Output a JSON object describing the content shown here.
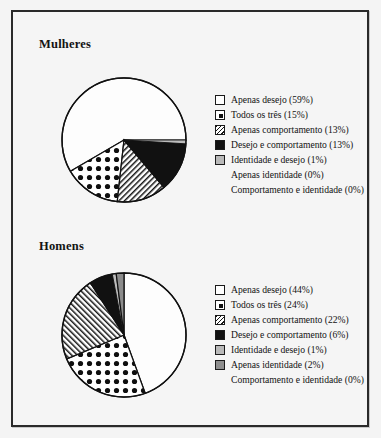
{
  "figure": {
    "background_color": "#f5f5f5",
    "border_color": "#2a2a2a"
  },
  "panels": [
    {
      "title": "Mulheres",
      "legend": [
        {
          "label": "Apenas desejo (59%)",
          "swatch": "plain"
        },
        {
          "label": "Todos os três (15%)",
          "swatch": "dots"
        },
        {
          "label": "Apenas comportamento (13%)",
          "swatch": "hatch"
        },
        {
          "label": "Desejo e comportamento (13%)",
          "swatch": "solid"
        },
        {
          "label": "Identidade e desejo (1%)",
          "swatch": "lgray"
        },
        {
          "label": "Apenas identidade (0%)",
          "swatch": "none"
        },
        {
          "label": "Comportamento e identidade (0%)",
          "swatch": "none"
        }
      ]
    },
    {
      "title": "Homens",
      "legend": [
        {
          "label": "Apenas desejo (44%)",
          "swatch": "plain"
        },
        {
          "label": "Todos os três (24%)",
          "swatch": "dots"
        },
        {
          "label": "Apenas comportamento (22%)",
          "swatch": "hatch"
        },
        {
          "label": "Desejo e comportamento (6%)",
          "swatch": "solid"
        },
        {
          "label": "Identidade e desejo (1%)",
          "swatch": "lgray"
        },
        {
          "label": "Apenas identidade (2%)",
          "swatch": "dgray"
        },
        {
          "label": "Comportamento e identidade (0%)",
          "swatch": "none"
        }
      ]
    }
  ],
  "chart_data": [
    {
      "type": "pie",
      "title": "Mulheres",
      "categories": [
        "Apenas desejo",
        "Todos os três",
        "Apenas comportamento",
        "Desejo e comportamento",
        "Identidade e desejo",
        "Apenas identidade",
        "Comportamento e identidade"
      ],
      "values": [
        59,
        15,
        13,
        13,
        1,
        0,
        0
      ],
      "unit": "%",
      "start_angle_deg": 0,
      "direction": "counterclockwise",
      "legend_position": "right",
      "patterns": [
        "plain",
        "dots",
        "hatch",
        "solid",
        "light-gray",
        "none",
        "none"
      ]
    },
    {
      "type": "pie",
      "title": "Homens",
      "categories": [
        "Apenas desejo",
        "Todos os três",
        "Apenas comportamento",
        "Desejo e comportamento",
        "Identidade e desejo",
        "Apenas identidade",
        "Comportamento e identidade"
      ],
      "values": [
        44,
        24,
        22,
        6,
        1,
        2,
        0
      ],
      "unit": "%",
      "start_angle_deg": 0,
      "direction": "counterclockwise",
      "legend_position": "right",
      "patterns": [
        "plain",
        "dots",
        "hatch",
        "solid",
        "light-gray",
        "dark-gray",
        "none"
      ]
    }
  ]
}
